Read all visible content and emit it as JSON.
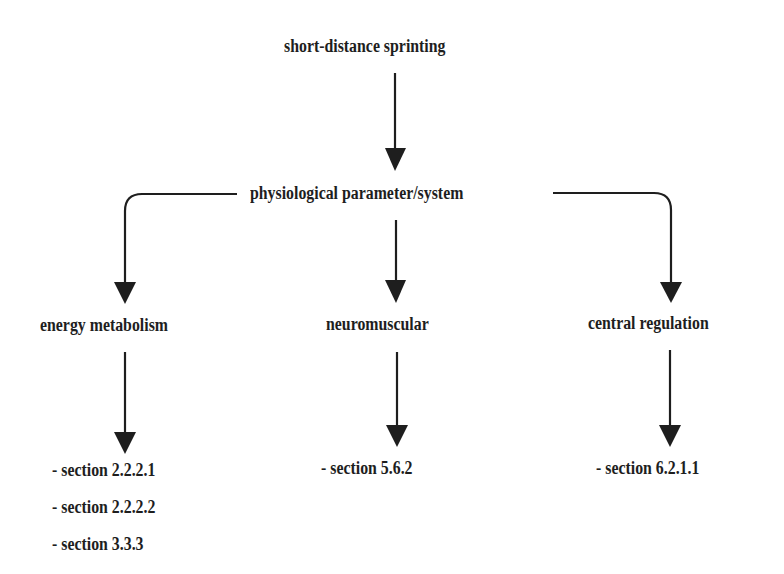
{
  "diagram": {
    "type": "flowchart",
    "root": {
      "label": "short-distance sprinting"
    },
    "level1": {
      "label": "physiological parameter/system"
    },
    "branches": [
      {
        "label": "energy metabolism",
        "sections": [
          "- section 2.2.2.1",
          "- section 2.2.2.2",
          "- section 3.3.3"
        ]
      },
      {
        "label": "neuromuscular",
        "sections": [
          "- section 5.6.2"
        ]
      },
      {
        "label": "central regulation",
        "sections": [
          "- section 6.2.1.1"
        ]
      }
    ],
    "colors": {
      "background": "#ffffff",
      "text": "#1e1e1e",
      "arrows": "#1e1e1e"
    }
  }
}
